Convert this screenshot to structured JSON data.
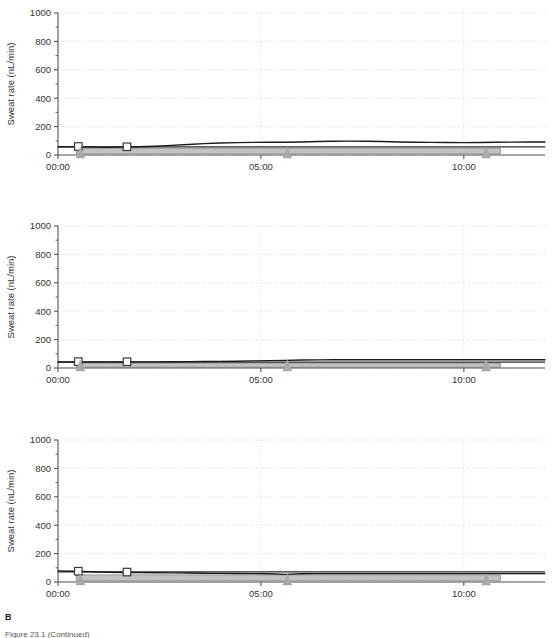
{
  "figure": {
    "panel_letter": "B",
    "caption": "Figure 23.1  (Continued)",
    "colors": {
      "curve": "#1a1a1a",
      "band_fill": "#c2c2c2",
      "band_edge": "#8a8a8a",
      "baseline": "#2b2b2b",
      "grid": "#cccccc",
      "axis": "#555555",
      "marker_square_edge": "#3a3a3a",
      "marker_square_fill": "#ffffff",
      "marker_triangle": "#a9a9a9",
      "text": "#333333"
    }
  },
  "chart_data": [
    {
      "type": "line",
      "title": "",
      "xlabel": "",
      "ylabel": "Sweat rate (nL/min)",
      "xlim": [
        0,
        12
      ],
      "ylim": [
        0,
        1000
      ],
      "yticks": [
        0,
        200,
        400,
        600,
        800,
        1000
      ],
      "yticklabels": [
        "0",
        "200",
        "400",
        "600",
        "800",
        "1000"
      ],
      "yminor_step": 100,
      "xticks": [
        0,
        5,
        10
      ],
      "xticklabels": [
        "00:00",
        "05:00",
        "10:00"
      ],
      "grid": true,
      "legend": "none",
      "series": [
        {
          "name": "sweat rate curve",
          "style": "line",
          "x": [
            0.0,
            0.4,
            0.8,
            1.2,
            1.6,
            2.0,
            2.4,
            2.8,
            3.2,
            3.6,
            4.0,
            4.4,
            4.8,
            5.2,
            5.6,
            6.0,
            6.4,
            6.8,
            7.2,
            7.6,
            8.0,
            8.4,
            8.8,
            9.2,
            9.6,
            10.0,
            10.4,
            10.8,
            11.2,
            11.6,
            12.0
          ],
          "y": [
            58,
            57,
            56,
            55,
            56,
            58,
            62,
            68,
            74,
            80,
            84,
            87,
            89,
            90,
            90,
            92,
            95,
            97,
            98,
            97,
            95,
            92,
            90,
            89,
            88,
            87,
            88,
            90,
            91,
            92,
            92
          ]
        },
        {
          "name": "baseline reference line",
          "style": "hline",
          "y": 57
        },
        {
          "name": "gray band",
          "style": "band",
          "x_start": 0.45,
          "x_end": 10.9,
          "y_low": 8,
          "y_high": 48
        }
      ],
      "markers_square": {
        "name": "open square markers",
        "x": [
          0.5,
          1.7
        ],
        "y": [
          60,
          58
        ]
      },
      "markers_triangle": {
        "name": "filled triangle markers",
        "x": [
          0.55,
          5.65,
          10.55
        ],
        "y": [
          0,
          0,
          0
        ]
      }
    },
    {
      "type": "line",
      "title": "",
      "xlabel": "",
      "ylabel": "Sweat rate (nL/min)",
      "xlim": [
        0,
        12
      ],
      "ylim": [
        0,
        1000
      ],
      "yticks": [
        0,
        200,
        400,
        600,
        800,
        1000
      ],
      "yticklabels": [
        "0",
        "200",
        "400",
        "600",
        "800",
        "1000"
      ],
      "yminor_step": 100,
      "xticks": [
        0,
        5,
        10
      ],
      "xticklabels": [
        "00:00",
        "05:00",
        "10:00"
      ],
      "grid": true,
      "legend": "none",
      "series": [
        {
          "name": "sweat rate curve",
          "style": "line",
          "x": [
            0.0,
            0.4,
            0.8,
            1.2,
            1.6,
            2.0,
            2.4,
            2.8,
            3.2,
            3.6,
            4.0,
            4.4,
            4.8,
            5.2,
            5.6,
            6.0,
            6.4,
            6.8,
            7.2,
            7.6,
            8.0,
            8.4,
            8.8,
            9.2,
            9.6,
            10.0,
            10.4,
            10.8,
            11.2,
            11.6,
            12.0
          ],
          "y": [
            42,
            42,
            42,
            42,
            42,
            43,
            43,
            44,
            45,
            46,
            47,
            48,
            50,
            52,
            54,
            56,
            57,
            58,
            58,
            58,
            58,
            58,
            58,
            58,
            58,
            58,
            58,
            58,
            58,
            58,
            58
          ]
        },
        {
          "name": "baseline reference line",
          "style": "hline",
          "y": 41
        },
        {
          "name": "gray band",
          "style": "band",
          "x_start": 0.45,
          "x_end": 10.9,
          "y_low": 6,
          "y_high": 34
        }
      ],
      "markers_square": {
        "name": "open square markers",
        "x": [
          0.5,
          1.7
        ],
        "y": [
          45,
          44
        ]
      },
      "markers_triangle": {
        "name": "filled triangle markers",
        "x": [
          0.55,
          5.65,
          10.55
        ],
        "y": [
          0,
          0,
          0
        ]
      }
    },
    {
      "type": "line",
      "title": "",
      "xlabel": "",
      "ylabel": "Sweat rate (nL/min)",
      "xlim": [
        0,
        12
      ],
      "ylim": [
        0,
        1000
      ],
      "yticks": [
        0,
        200,
        400,
        600,
        800,
        1000
      ],
      "yticklabels": [
        "0",
        "200",
        "400",
        "600",
        "800",
        "1000"
      ],
      "yminor_step": 100,
      "xticks": [
        0,
        5,
        10
      ],
      "xticklabels": [
        "00:00",
        "05:00",
        "10:00"
      ],
      "grid": true,
      "legend": "none",
      "series": [
        {
          "name": "sweat rate curve",
          "style": "line",
          "x": [
            0.0,
            0.4,
            0.8,
            1.2,
            1.6,
            2.0,
            2.4,
            2.8,
            3.2,
            3.6,
            4.0,
            4.4,
            4.8,
            5.2,
            5.6,
            6.0,
            6.4,
            6.8,
            7.2,
            7.6,
            8.0,
            8.4,
            8.8,
            9.2,
            9.6,
            10.0,
            10.4,
            10.8,
            11.2,
            11.6,
            12.0
          ],
          "y": [
            78,
            76,
            72,
            69,
            67,
            66,
            65,
            64,
            63,
            62,
            61,
            60,
            59,
            58,
            54,
            58,
            59,
            59,
            59,
            59,
            59,
            59,
            59,
            59,
            59,
            59,
            59,
            59,
            59,
            59,
            59
          ]
        },
        {
          "name": "baseline reference line",
          "style": "hline",
          "y": 72
        },
        {
          "name": "gray band",
          "style": "band",
          "x_start": 0.45,
          "x_end": 10.9,
          "y_low": 8,
          "y_high": 50
        }
      ],
      "markers_square": {
        "name": "open square markers",
        "x": [
          0.5,
          1.7
        ],
        "y": [
          76,
          70
        ]
      },
      "markers_triangle": {
        "name": "filled triangle markers",
        "x": [
          0.55,
          5.65,
          10.55
        ],
        "y": [
          0,
          0,
          0
        ]
      }
    }
  ]
}
